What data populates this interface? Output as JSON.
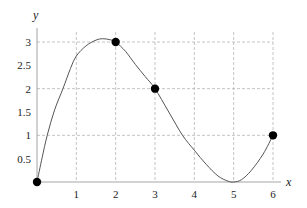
{
  "chart_data": {
    "type": "line",
    "title": "",
    "xlabel": "x",
    "ylabel": "y",
    "xlim": [
      0,
      6
    ],
    "ylim": [
      0,
      3
    ],
    "grid": true,
    "grid_style": "dashed",
    "x_ticks": [
      1,
      2,
      3,
      4,
      5,
      6
    ],
    "x_tick_labels": [
      "1",
      "2",
      "3",
      "4",
      "5",
      "6"
    ],
    "y_ticks": [
      0.5,
      1,
      1.5,
      2,
      2.5,
      3
    ],
    "y_tick_labels": [
      "0.5",
      "1",
      "1.5",
      "2",
      "2.5",
      "3"
    ],
    "y_gridlines": [
      1,
      2,
      3
    ],
    "x_gridlines": [
      1,
      2,
      3,
      4,
      5,
      6
    ],
    "series": [
      {
        "name": "interpolating curve",
        "kind": "curve",
        "x": [
          0,
          0.13,
          0.26,
          0.45,
          0.66,
          0.85,
          1.0,
          1.25,
          1.5,
          1.67,
          1.85,
          2.0,
          2.25,
          2.5,
          2.75,
          3.0,
          3.35,
          3.7,
          4.0,
          4.3,
          4.6,
          4.85,
          5.0,
          5.2,
          5.45,
          5.75,
          6.0
        ],
        "y": [
          0,
          0.52,
          1.0,
          1.55,
          2.0,
          2.43,
          2.7,
          2.92,
          3.04,
          3.07,
          3.05,
          3.0,
          2.8,
          2.52,
          2.26,
          2.0,
          1.5,
          1.0,
          0.68,
          0.38,
          0.13,
          0.02,
          0,
          0.05,
          0.25,
          0.6,
          1.0
        ]
      },
      {
        "name": "data points",
        "kind": "points",
        "x": [
          0,
          2,
          3,
          6
        ],
        "y": [
          0,
          3,
          2,
          1
        ]
      }
    ],
    "minimum": {
      "x": 5,
      "y": 0
    },
    "maximum_approx": {
      "x": 1.67,
      "y": 3.07
    }
  }
}
